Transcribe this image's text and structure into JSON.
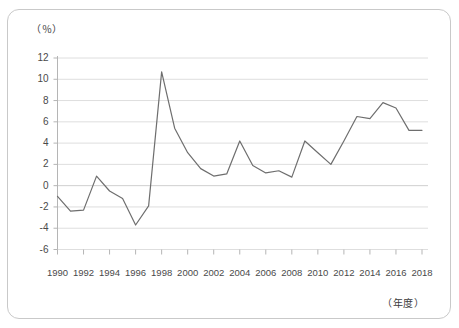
{
  "figure": {
    "y_axis_unit": "（％）",
    "x_axis_unit": "（年度）",
    "border_color": "#c9c9c9",
    "line_color": "#6e6e6e",
    "grid_color": "#dedede",
    "axis_color": "#b5b5b5",
    "text_color": "#4a4a4a"
  },
  "chart_data": {
    "type": "line",
    "title": "",
    "subtitle": "",
    "xlabel": "（年度）",
    "ylabel": "（％）",
    "ylim": [
      -6,
      12
    ],
    "xlim": [
      1990,
      2018
    ],
    "grid": true,
    "legend": null,
    "y_ticks": [
      -6,
      -4,
      -2,
      0,
      2,
      4,
      6,
      8,
      10,
      12
    ],
    "y_tick_labels": [
      "-6",
      "-4",
      "-2",
      "0",
      "2",
      "4",
      "6",
      "8",
      "10",
      "12"
    ],
    "x_ticks": [
      1990,
      1992,
      1994,
      1996,
      1998,
      2000,
      2002,
      2004,
      2006,
      2008,
      2010,
      2012,
      2014,
      2016,
      2018
    ],
    "x_tick_labels": [
      "1990",
      "1992",
      "1994",
      "1996",
      "1998",
      "2000",
      "2002",
      "2004",
      "2006",
      "2008",
      "2010",
      "2012",
      "2014",
      "2016",
      "2018"
    ],
    "x": [
      1990,
      1991,
      1992,
      1993,
      1994,
      1995,
      1996,
      1997,
      1998,
      1999,
      2000,
      2001,
      2002,
      2003,
      2004,
      2005,
      2006,
      2007,
      2008,
      2009,
      2010,
      2011,
      2012,
      2013,
      2014,
      2015,
      2016,
      2017,
      2018
    ],
    "values": [
      -1.0,
      -2.4,
      -2.3,
      0.9,
      -0.5,
      -1.2,
      -3.7,
      -1.9,
      10.7,
      5.4,
      3.1,
      1.6,
      0.9,
      1.1,
      4.2,
      1.9,
      1.2,
      1.4,
      0.8,
      4.2,
      3.1,
      2.0,
      4.2,
      6.5,
      6.3,
      7.8,
      7.3,
      5.2,
      5.2
    ],
    "series": [
      {
        "name": "",
        "values": [
          -1.0,
          -2.4,
          -2.3,
          0.9,
          -0.5,
          -1.2,
          -3.7,
          -1.9,
          10.7,
          5.4,
          3.1,
          1.6,
          0.9,
          1.1,
          4.2,
          1.9,
          1.2,
          1.4,
          0.8,
          4.2,
          3.1,
          2.0,
          4.2,
          6.5,
          6.3,
          7.8,
          7.3,
          5.2,
          5.2
        ]
      }
    ]
  }
}
